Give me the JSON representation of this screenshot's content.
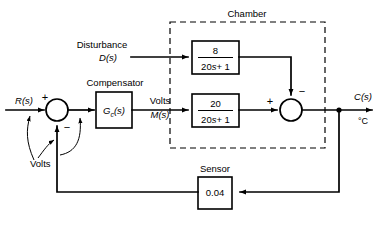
{
  "diagram": {
    "chamber": {
      "label": "Chamber"
    },
    "inputs": {
      "reference": "R(s)",
      "disturbance_label": "Disturbance",
      "disturbance": "D(s)"
    },
    "outputs": {
      "controlled": "C(s)",
      "unit": "°C"
    },
    "compensator": {
      "caption": "Compensator",
      "transfer": "G",
      "transfer_sub": "c",
      "transfer_arg": "(s)",
      "signal_unit": "Volts",
      "signal_name": "M(s)"
    },
    "disturbance_block": {
      "numerator": "8",
      "denominator_coef": "20",
      "denominator_var": "s",
      "denominator_const": "+ 1"
    },
    "plant_block": {
      "numerator": "20",
      "denominator_coef": "20",
      "denominator_var": "s",
      "denominator_const": "+ 1"
    },
    "sensor": {
      "caption": "Sensor",
      "gain": "0.04"
    },
    "annotations": {
      "volts": "Volts"
    },
    "summing_junction_1": {
      "plus": "+",
      "minus": "−"
    },
    "summing_junction_2": {
      "plus": "+",
      "minus": "−"
    },
    "colors": {
      "line": "#000000",
      "background": "#ffffff"
    }
  }
}
